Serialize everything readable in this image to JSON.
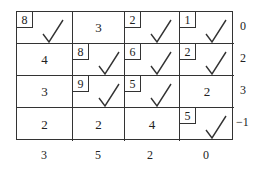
{
  "grid": [
    [
      {
        "value": "8",
        "boxed": true,
        "check": true
      },
      {
        "value": "3",
        "boxed": false,
        "check": false
      },
      {
        "value": "2",
        "boxed": true,
        "check": true
      },
      {
        "value": "1",
        "boxed": true,
        "check": true
      }
    ],
    [
      {
        "value": "4",
        "boxed": false,
        "check": false
      },
      {
        "value": "8",
        "boxed": true,
        "check": true
      },
      {
        "value": "6",
        "boxed": true,
        "check": true
      },
      {
        "value": "2",
        "boxed": true,
        "check": true
      }
    ],
    [
      {
        "value": "3",
        "boxed": false,
        "check": false
      },
      {
        "value": "9",
        "boxed": true,
        "check": true
      },
      {
        "value": "5",
        "boxed": true,
        "check": true
      },
      {
        "value": "2",
        "boxed": false,
        "check": false
      }
    ],
    [
      {
        "value": "2",
        "boxed": false,
        "check": false
      },
      {
        "value": "2",
        "boxed": false,
        "check": false
      },
      {
        "value": "4",
        "boxed": false,
        "check": false
      },
      {
        "value": "5",
        "boxed": true,
        "check": true
      }
    ]
  ],
  "row_potentials": [
    "0",
    "2",
    "3",
    "−1"
  ],
  "col_potentials": [
    "3",
    "5",
    "2",
    "0"
  ],
  "check_icon": "checkmark-icon"
}
